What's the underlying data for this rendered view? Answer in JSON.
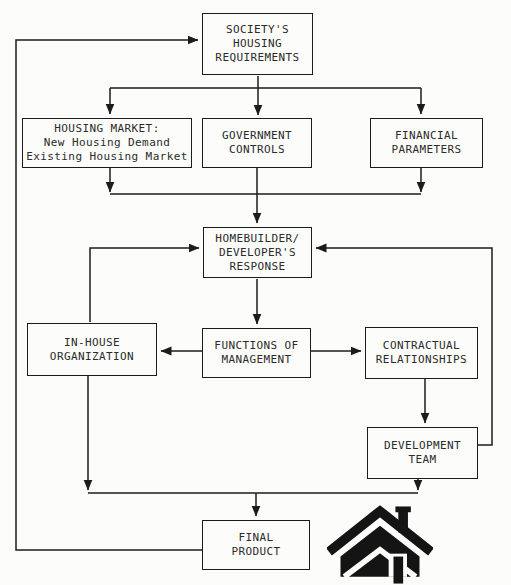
{
  "diagram": {
    "type": "flowchart",
    "colors": {
      "background": "#fcfcfa",
      "line": "#1c1c1c",
      "box_border": "#1c1c1c",
      "text": "#2b2b2b",
      "house_logo": "#141414"
    },
    "nodes": {
      "society": {
        "label": "SOCIETY'S\nHOUSING\nREQUIREMENTS"
      },
      "housing_market": {
        "label": "HOUSING MARKET:\nNew Housing Demand\nExisting Housing Market"
      },
      "government": {
        "label": "GOVERNMENT\nCONTROLS"
      },
      "financial": {
        "label": "FINANCIAL\nPARAMETERS"
      },
      "homebuilder": {
        "label": "HOMEBUILDER/\nDEVELOPER'S\nRESPONSE"
      },
      "inhouse": {
        "label": "IN-HOUSE\nORGANIZATION"
      },
      "functions": {
        "label": "FUNCTIONS OF\nMANAGEMENT"
      },
      "contractual": {
        "label": "CONTRACTUAL\nRELATIONSHIPS"
      },
      "devteam": {
        "label": "DEVELOPMENT\nTEAM"
      },
      "final": {
        "label": "FINAL\nPRODUCT"
      }
    },
    "edges": [
      {
        "from": "final",
        "to": "society"
      },
      {
        "from": "society",
        "to": "housing_market"
      },
      {
        "from": "society",
        "to": "government"
      },
      {
        "from": "society",
        "to": "financial"
      },
      {
        "from": "housing_market",
        "to": "homebuilder"
      },
      {
        "from": "government",
        "to": "homebuilder"
      },
      {
        "from": "financial",
        "to": "homebuilder"
      },
      {
        "from": "inhouse",
        "to": "homebuilder"
      },
      {
        "from": "devteam",
        "to": "homebuilder"
      },
      {
        "from": "homebuilder",
        "to": "functions"
      },
      {
        "from": "functions",
        "to": "inhouse"
      },
      {
        "from": "functions",
        "to": "contractual"
      },
      {
        "from": "contractual",
        "to": "devteam"
      },
      {
        "from": "inhouse",
        "to": "final"
      },
      {
        "from": "devteam",
        "to": "final"
      }
    ],
    "icons": {
      "house_logo": "solid black house silhouette with gable roof, chimney and door"
    }
  }
}
